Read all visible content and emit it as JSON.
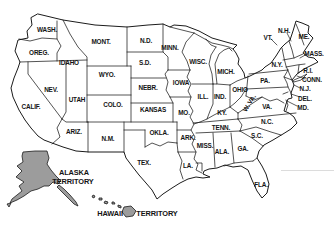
{
  "map": {
    "description": "United States map with state abbreviations, Alaska Territory and Hawaii Territory shaded",
    "colors": {
      "background": "#ffffff",
      "line": "#1b1b1b",
      "territory_fill": "#9c9c9c"
    },
    "state_labels": [
      {
        "text": "WASH.",
        "x": 47,
        "y": 29
      },
      {
        "text": "OREG.",
        "x": 39,
        "y": 52
      },
      {
        "text": "IDAHO",
        "x": 69,
        "y": 62
      },
      {
        "text": "MONT.",
        "x": 101,
        "y": 41
      },
      {
        "text": "WYO.",
        "x": 107,
        "y": 74
      },
      {
        "text": "NEV.",
        "x": 51,
        "y": 89
      },
      {
        "text": "UTAH",
        "x": 77,
        "y": 99
      },
      {
        "text": "CALIF.",
        "x": 31,
        "y": 106
      },
      {
        "text": "COLO.",
        "x": 113,
        "y": 104
      },
      {
        "text": "ARIZ.",
        "x": 74,
        "y": 131
      },
      {
        "text": "N.M.",
        "x": 108,
        "y": 138
      },
      {
        "text": "N.D.",
        "x": 146,
        "y": 40
      },
      {
        "text": "S.D.",
        "x": 145,
        "y": 62
      },
      {
        "text": "NEBR.",
        "x": 148,
        "y": 87
      },
      {
        "text": "KANSAS",
        "x": 153,
        "y": 109
      },
      {
        "text": "OKLA.",
        "x": 159,
        "y": 132
      },
      {
        "text": "TEX.",
        "x": 144,
        "y": 162
      },
      {
        "text": "MINN.",
        "x": 170,
        "y": 47
      },
      {
        "text": "WISC.",
        "x": 198,
        "y": 61
      },
      {
        "text": "MICH.",
        "x": 226,
        "y": 71
      },
      {
        "text": "IOWA",
        "x": 181,
        "y": 82
      },
      {
        "text": "ILL.",
        "x": 203,
        "y": 96
      },
      {
        "text": "IND.",
        "x": 220,
        "y": 96
      },
      {
        "text": "OHIO",
        "x": 240,
        "y": 89
      },
      {
        "text": "MO.",
        "x": 184,
        "y": 112
      },
      {
        "text": "KY.",
        "x": 222,
        "y": 112
      },
      {
        "text": "TENN.",
        "x": 221,
        "y": 127
      },
      {
        "text": "ARK.",
        "x": 188,
        "y": 137
      },
      {
        "text": "MISS.",
        "x": 205,
        "y": 145
      },
      {
        "text": "ALA.",
        "x": 222,
        "y": 151
      },
      {
        "text": "GA.",
        "x": 243,
        "y": 148
      },
      {
        "text": "LA.",
        "x": 188,
        "y": 165
      },
      {
        "text": "FLA.",
        "x": 261,
        "y": 184
      },
      {
        "text": "S.C.",
        "x": 257,
        "y": 135
      },
      {
        "text": "N.C.",
        "x": 267,
        "y": 121
      },
      {
        "text": "VA.",
        "x": 267,
        "y": 106
      },
      {
        "text": "W. VA.",
        "x": 249,
        "y": 103,
        "rotate": -58
      },
      {
        "text": "PA.",
        "x": 265,
        "y": 80
      },
      {
        "text": "N.Y.",
        "x": 277,
        "y": 64
      },
      {
        "text": "VT.",
        "x": 268,
        "y": 37
      },
      {
        "text": "N.H.",
        "x": 284,
        "y": 30
      },
      {
        "text": "ME.",
        "x": 304,
        "y": 36
      },
      {
        "text": "MASS.",
        "x": 314,
        "y": 53
      },
      {
        "text": "R.I.",
        "x": 308,
        "y": 70
      },
      {
        "text": "CONN.",
        "x": 312,
        "y": 79
      },
      {
        "text": "N.J.",
        "x": 305,
        "y": 88
      },
      {
        "text": "DEL.",
        "x": 305,
        "y": 98
      },
      {
        "text": "MD.",
        "x": 303,
        "y": 107
      }
    ],
    "territory_labels": [
      {
        "text": "ALASKA",
        "x": 74,
        "y": 172
      },
      {
        "text": "TERRITORY",
        "x": 73,
        "y": 181
      },
      {
        "text": "HAWAII",
        "x": 110,
        "y": 213
      },
      {
        "text": "TERRITORY",
        "x": 157,
        "y": 213
      }
    ]
  }
}
